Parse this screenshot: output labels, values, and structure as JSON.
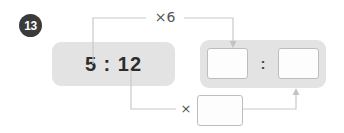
{
  "question": {
    "number": "13",
    "badge_color": "#3b3b3b"
  },
  "given": {
    "ratio_text": "5 : 12",
    "antecedent": "5",
    "consequent": "12",
    "separator": ":"
  },
  "answer": {
    "antecedent_value": "",
    "consequent_value": "",
    "separator": ":",
    "antecedent_placeholder": "",
    "consequent_placeholder": ""
  },
  "multiplier": {
    "value": "",
    "placeholder": ""
  },
  "operators": {
    "top_label": "×6",
    "bottom_label": "×"
  },
  "icons": {
    "top_arrow": "arrow-down-icon",
    "bottom_arrow": "arrow-up-icon"
  },
  "colors": {
    "panel": "#e3e3e3",
    "connector": "#c9c9c9",
    "box_border": "#bdbdbd",
    "text": "#2d2d2d"
  }
}
